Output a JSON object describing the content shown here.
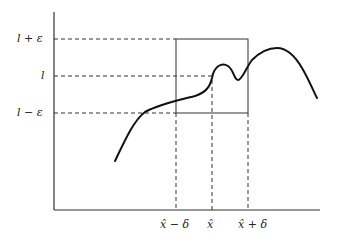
{
  "diagram": {
    "title": "",
    "y_labels": {
      "upper": "l + ε",
      "middle": "l",
      "lower": "l − ε"
    },
    "x_labels": {
      "left": "x̂ − δ",
      "center": "x̂",
      "right": "x̂ + δ"
    },
    "colors": {
      "stroke": "#333333",
      "curve": "#111111",
      "background": "#ffffff"
    }
  }
}
